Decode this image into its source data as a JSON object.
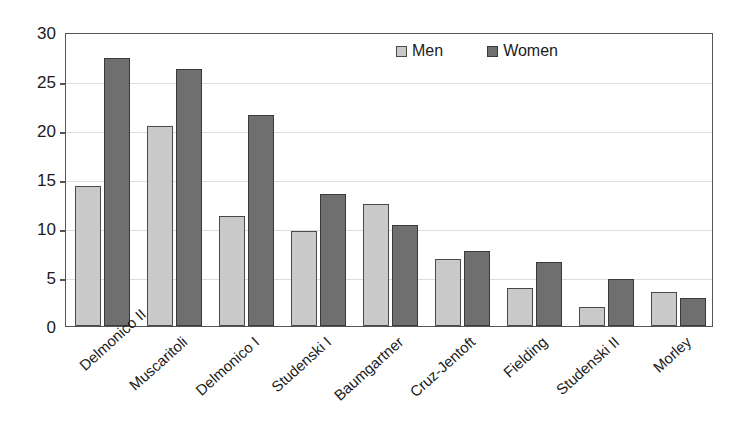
{
  "chart_data": {
    "type": "bar",
    "title": "",
    "subtitle": "",
    "xlabel": "",
    "ylabel": "",
    "ylim": [
      0,
      30
    ],
    "yticks": [
      0,
      5,
      10,
      15,
      20,
      25,
      30
    ],
    "ytick_labels": [
      "0",
      "5",
      "10",
      "15",
      "20",
      "25",
      "30"
    ],
    "grid": true,
    "legend_position": "top-center-inside",
    "categories": [
      "Delmonico II",
      "Muscaritoli",
      "Delmonico I",
      "Studenski I",
      "Baumgartner",
      "Cruz-Jentoft",
      "Fielding",
      "Studenski II",
      "Morley"
    ],
    "series": [
      {
        "name": "Men",
        "color": "#c9c9c9",
        "values": [
          14.3,
          20.4,
          11.2,
          9.7,
          12.4,
          6.8,
          3.9,
          1.9,
          3.5
        ]
      },
      {
        "name": "Women",
        "color": "#6f6f6f",
        "values": [
          27.3,
          26.2,
          21.5,
          13.5,
          10.3,
          7.7,
          6.5,
          4.8,
          2.9
        ]
      }
    ]
  },
  "legend": {
    "entries": [
      {
        "label": "Men",
        "swatch": "men"
      },
      {
        "label": "Women",
        "swatch": "women"
      }
    ]
  }
}
